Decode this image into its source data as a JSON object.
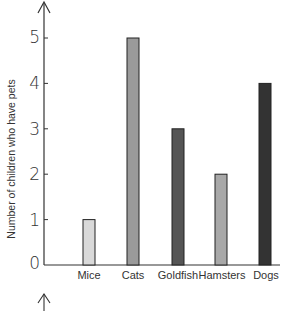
{
  "chart_data": {
    "type": "bar",
    "title": "",
    "xlabel": "",
    "ylabel": "Number of children who have pets",
    "categories": [
      "Mice",
      "Cats",
      "Goldfish",
      "Hamsters",
      "Dogs"
    ],
    "values": [
      1,
      5,
      3,
      2,
      4
    ],
    "bar_colors": [
      "#d9d9d9",
      "#9a9a9a",
      "#555555",
      "#a8a8a8",
      "#333333"
    ],
    "ylim": [
      0,
      5
    ],
    "yticks": [
      "0",
      "1",
      "2",
      "3",
      "4",
      "5"
    ],
    "grid": false,
    "legend": null,
    "annotations": [
      "arrow at top of y-axis",
      "arrow pointing up below x-axis"
    ]
  },
  "axis": {
    "ylabel": "Number of children who have pets",
    "ticks": [
      "0",
      "1",
      "2",
      "3",
      "4",
      "5"
    ]
  },
  "labels": {
    "mice": "Mice",
    "cats": "Cats",
    "goldfish": "Goldfish",
    "hamsters": "Hamsters",
    "dogs": "Dogs"
  }
}
